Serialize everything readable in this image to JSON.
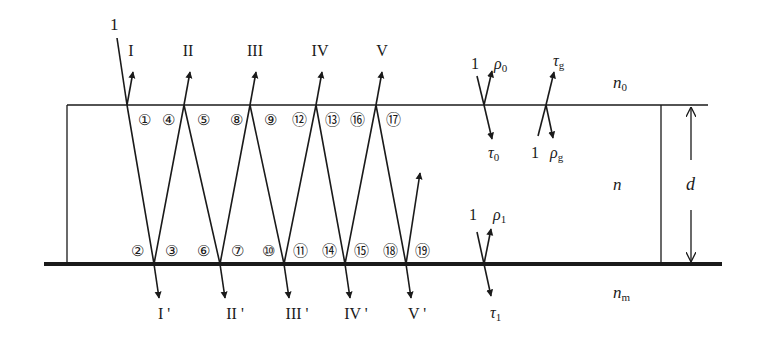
{
  "diagram": {
    "media": {
      "top": "n",
      "top_sub": "0",
      "film": "n",
      "bottom": "n",
      "bottom_sub": "m"
    },
    "thickness_label": "d",
    "incident_label": "1",
    "reflected_beams": [
      "I",
      "II",
      "III",
      "IV",
      "V"
    ],
    "transmitted_beams": [
      "I '",
      "II '",
      "III '",
      "IV '",
      "V '"
    ],
    "top_interface_points": [
      "①",
      "④",
      "⑤",
      "⑧",
      "⑨",
      "⑫",
      "⑬",
      "⑯",
      "⑰"
    ],
    "bottom_interface_points": [
      "②",
      "③",
      "⑥",
      "⑦",
      "⑩",
      "⑪",
      "⑭",
      "⑮",
      "⑱",
      "⑲"
    ],
    "legend": {
      "top_from_outside": {
        "incident": "1",
        "reflected": "ρ",
        "reflected_sub": "0",
        "transmitted": "τ",
        "transmitted_sub": "0"
      },
      "top_from_inside": {
        "incident": "1",
        "reflected": "ρ",
        "reflected_sub": "g",
        "transmitted": "τ",
        "transmitted_sub": "g"
      },
      "bottom": {
        "incident": "1",
        "reflected": "ρ",
        "reflected_sub": "1",
        "transmitted": "τ",
        "transmitted_sub": "1"
      }
    },
    "colors": {
      "line": "#1a1a1a",
      "background": "#ffffff"
    }
  }
}
